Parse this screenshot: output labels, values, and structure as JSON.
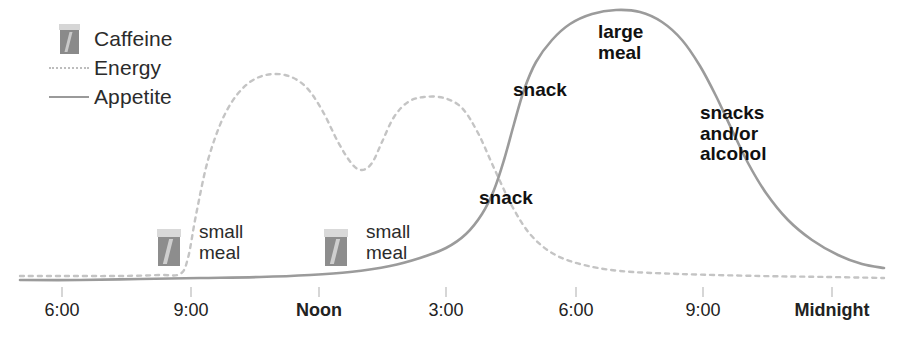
{
  "chart_data": {
    "type": "line",
    "title": "",
    "xlabel": "",
    "ylabel": "",
    "grid": false,
    "legend_position": "top-left",
    "xlim": [
      5.0,
      24.5
    ],
    "ylim": [
      0,
      100
    ],
    "x_ticks": [
      {
        "label": "6:00",
        "hour": 6,
        "bold": false,
        "px": 62
      },
      {
        "label": "9:00",
        "hour": 9,
        "bold": false,
        "px": 191
      },
      {
        "label": "Noon",
        "hour": 12,
        "bold": true,
        "px": 319
      },
      {
        "label": "3:00",
        "hour": 15,
        "bold": false,
        "px": 446
      },
      {
        "label": "6:00",
        "hour": 18,
        "bold": false,
        "px": 576
      },
      {
        "label": "9:00",
        "hour": 21,
        "bold": false,
        "px": 703
      },
      {
        "label": "Midnight",
        "hour": 24,
        "bold": true,
        "px": 832
      }
    ],
    "series": [
      {
        "name": "Energy",
        "style": "dashed",
        "color": "#c4c4c4",
        "points_px": [
          [
            20,
            276
          ],
          [
            60,
            276
          ],
          [
            120,
            276
          ],
          [
            160,
            275
          ],
          [
            180,
            274
          ],
          [
            188,
            258
          ],
          [
            196,
            215
          ],
          [
            208,
            160
          ],
          [
            224,
            116
          ],
          [
            242,
            89
          ],
          [
            262,
            76
          ],
          [
            285,
            75
          ],
          [
            305,
            86
          ],
          [
            322,
            110
          ],
          [
            338,
            142
          ],
          [
            352,
            164
          ],
          [
            362,
            170
          ],
          [
            372,
            163
          ],
          [
            382,
            142
          ],
          [
            394,
            117
          ],
          [
            408,
            102
          ],
          [
            424,
            97
          ],
          [
            444,
            98
          ],
          [
            462,
            108
          ],
          [
            478,
            133
          ],
          [
            494,
            168
          ],
          [
            512,
            206
          ],
          [
            530,
            234
          ],
          [
            552,
            253
          ],
          [
            580,
            264
          ],
          [
            620,
            271
          ],
          [
            680,
            274
          ],
          [
            760,
            276
          ],
          [
            830,
            277
          ],
          [
            884,
            278
          ]
        ],
        "description": "Caffeine-driven energy: flat overnight baseline, steep rise after 9:00 coffee, peak late morning, dip early afternoon, second peak after 3:00 coffee, then sustained decline into evening."
      },
      {
        "name": "Appetite",
        "style": "solid",
        "color": "#9b9b9b",
        "points_px": [
          [
            20,
            280
          ],
          [
            80,
            280
          ],
          [
            140,
            279
          ],
          [
            200,
            278
          ],
          [
            260,
            277
          ],
          [
            310,
            275
          ],
          [
            350,
            272
          ],
          [
            390,
            266
          ],
          [
            420,
            258
          ],
          [
            446,
            248
          ],
          [
            466,
            234
          ],
          [
            482,
            214
          ],
          [
            494,
            190
          ],
          [
            504,
            160
          ],
          [
            514,
            124
          ],
          [
            524,
            90
          ],
          [
            536,
            62
          ],
          [
            552,
            40
          ],
          [
            570,
            24
          ],
          [
            592,
            14
          ],
          [
            616,
            10
          ],
          [
            640,
            12
          ],
          [
            662,
            22
          ],
          [
            682,
            40
          ],
          [
            700,
            66
          ],
          [
            716,
            96
          ],
          [
            732,
            130
          ],
          [
            748,
            163
          ],
          [
            766,
            193
          ],
          [
            788,
            220
          ],
          [
            812,
            240
          ],
          [
            838,
            255
          ],
          [
            862,
            264
          ],
          [
            884,
            268
          ]
        ],
        "description": "Appetite suppressed all day by caffeine, then surges steeply after the afternoon snack, peaks around 6-7pm with a large meal, and tapers through late-evening snacking."
      }
    ],
    "annotations": [
      {
        "text": "small\nmeal",
        "bold": false,
        "x_px": 199,
        "y_px": 222,
        "anchor_hour": 8.7
      },
      {
        "text": "small\nmeal",
        "bold": false,
        "x_px": 366,
        "y_px": 222,
        "anchor_hour": 12.6
      },
      {
        "text": "snack",
        "bold": true,
        "x_px": 479,
        "y_px": 188,
        "anchor_hour": 15.4
      },
      {
        "text": "snack",
        "bold": true,
        "x_px": 513,
        "y_px": 80,
        "anchor_hour": 16.2
      },
      {
        "text": "large\nmeal",
        "bold": true,
        "x_px": 598,
        "y_px": 22,
        "anchor_hour": 18.1
      },
      {
        "text": "snacks\nand/or\nalcohol",
        "bold": true,
        "x_px": 700,
        "y_px": 103,
        "anchor_hour": 20.6
      }
    ],
    "markers": [
      {
        "name": "caffeine-cup",
        "x_px": 157,
        "y_px": 229,
        "hour": 8.6
      },
      {
        "name": "caffeine-cup",
        "x_px": 324,
        "y_px": 229,
        "hour": 12.3
      }
    ]
  },
  "legend": {
    "items": [
      {
        "label": "Caffeine",
        "key": "coffee-cup-icon",
        "style": "icon"
      },
      {
        "label": "Energy",
        "key": "dashed-line",
        "style": "dashed"
      },
      {
        "label": "Appetite",
        "key": "solid-line",
        "style": "solid"
      }
    ]
  },
  "colors": {
    "energy_line": "#c4c4c4",
    "appetite_line": "#9b9b9b",
    "cup_body": "#8d8d8d",
    "cup_lid": "#d9d9d9",
    "text": "#111111",
    "background": "#ffffff"
  }
}
